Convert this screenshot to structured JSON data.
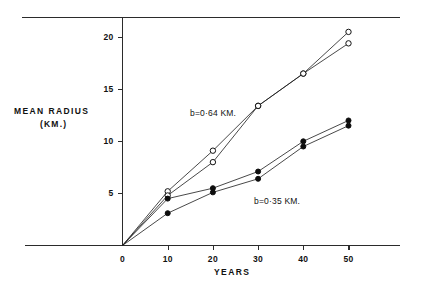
{
  "figure": {
    "background": "#ffffff",
    "ink_color": "#111111"
  },
  "axes": {
    "y_title": "MEAN RADIUS",
    "y_unit": "(KM.)",
    "x_title": "YEARS",
    "y_ticks": [
      "5",
      "10",
      "15",
      "20"
    ],
    "x_ticks": [
      "0",
      "10",
      "20",
      "30",
      "40",
      "50"
    ]
  },
  "annotations": {
    "upper": "b=0·64 KM.",
    "lower": "b=0·35 KM."
  },
  "chart_data": {
    "type": "line",
    "title": "",
    "subtitle": "",
    "xlabel": "YEARS",
    "ylabel": "MEAN RADIUS (KM.)",
    "xlim": [
      0,
      55
    ],
    "ylim": [
      0,
      22
    ],
    "x_ticks": [
      0,
      10,
      20,
      30,
      40,
      50
    ],
    "y_ticks": [
      5,
      10,
      15,
      20
    ],
    "grid": false,
    "legend": "none",
    "annotations": [
      {
        "text": "b=0·64 KM.",
        "x": 15,
        "y": 14.6,
        "refers_to": "open-circle series"
      },
      {
        "text": "b=0·35 KM.",
        "x": 31,
        "y": 5.4,
        "refers_to": "filled-circle series"
      }
    ],
    "x": [
      0,
      10,
      20,
      30,
      40,
      50
    ],
    "series": [
      {
        "name": "open-circle-series-1",
        "marker": "open-circle",
        "values": [
          0,
          5.2,
          9.1,
          13.4,
          16.5,
          20.5
        ]
      },
      {
        "name": "open-circle-series-2",
        "marker": "open-circle",
        "values": [
          0,
          4.8,
          8.0,
          13.4,
          16.5,
          19.4
        ]
      },
      {
        "name": "filled-circle-series-1",
        "marker": "filled-circle",
        "values": [
          0,
          4.5,
          5.5,
          7.1,
          10.0,
          12.0
        ]
      },
      {
        "name": "filled-circle-series-2",
        "marker": "filled-circle",
        "values": [
          0,
          3.1,
          5.1,
          6.4,
          9.5,
          11.5
        ]
      }
    ]
  }
}
